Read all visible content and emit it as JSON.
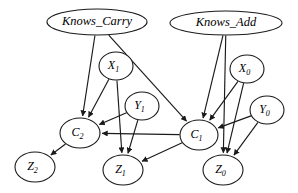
{
  "diagram": {
    "type": "directed-acyclic-graph",
    "background_color": "#ffffff",
    "stroke_color": "#1a1a1a",
    "nodes": [
      {
        "id": "knows_carry",
        "label": "Knows_Carry",
        "base": "Knows_Carry",
        "sub": "",
        "cx": 97,
        "cy": 22,
        "rx": 50,
        "ry": 13,
        "kind": "root-skill"
      },
      {
        "id": "knows_add",
        "label": "Knows_Add",
        "base": "Knows_Add",
        "sub": "",
        "cx": 226,
        "cy": 23,
        "rx": 56,
        "ry": 12,
        "kind": "root-skill"
      },
      {
        "id": "x1",
        "label": "X1",
        "base": "X",
        "sub": "1",
        "cx": 116,
        "cy": 66,
        "rx": 17,
        "ry": 14,
        "kind": "input"
      },
      {
        "id": "x0",
        "label": "X0",
        "base": "X",
        "sub": "0",
        "cx": 247,
        "cy": 69,
        "rx": 17,
        "ry": 14,
        "kind": "input"
      },
      {
        "id": "y1",
        "label": "Y1",
        "base": "Y",
        "sub": "1",
        "cx": 142,
        "cy": 106,
        "rx": 17,
        "ry": 14,
        "kind": "input"
      },
      {
        "id": "y0",
        "label": "Y0",
        "base": "Y",
        "sub": "0",
        "cx": 267,
        "cy": 110,
        "rx": 17,
        "ry": 14,
        "kind": "input"
      },
      {
        "id": "c2",
        "label": "C2",
        "base": "C",
        "sub": "2",
        "cx": 80,
        "cy": 133,
        "rx": 20,
        "ry": 15,
        "kind": "carry"
      },
      {
        "id": "c1",
        "label": "C1",
        "base": "C",
        "sub": "1",
        "cx": 199,
        "cy": 135,
        "rx": 19,
        "ry": 15,
        "kind": "carry"
      },
      {
        "id": "z2",
        "label": "Z2",
        "base": "Z",
        "sub": "2",
        "cx": 35,
        "cy": 167,
        "rx": 20,
        "ry": 15,
        "kind": "output"
      },
      {
        "id": "z1",
        "label": "Z1",
        "base": "Z",
        "sub": "1",
        "cx": 123,
        "cy": 170,
        "rx": 20,
        "ry": 15,
        "kind": "output"
      },
      {
        "id": "z0",
        "label": "Z0",
        "base": "Z",
        "sub": "0",
        "cx": 223,
        "cy": 170,
        "rx": 20,
        "ry": 15,
        "kind": "output"
      }
    ],
    "edges": [
      {
        "from": "knows_carry",
        "to": "c2"
      },
      {
        "from": "knows_carry",
        "to": "c1"
      },
      {
        "from": "knows_add",
        "to": "c1"
      },
      {
        "from": "knows_add",
        "to": "z0"
      },
      {
        "from": "x1",
        "to": "c2"
      },
      {
        "from": "x1",
        "to": "z1"
      },
      {
        "from": "y1",
        "to": "c2"
      },
      {
        "from": "y1",
        "to": "z1"
      },
      {
        "from": "x0",
        "to": "c1"
      },
      {
        "from": "x0",
        "to": "z0"
      },
      {
        "from": "y0",
        "to": "c1"
      },
      {
        "from": "y0",
        "to": "z0"
      },
      {
        "from": "c1",
        "to": "c2"
      },
      {
        "from": "c1",
        "to": "z1"
      },
      {
        "from": "c2",
        "to": "z2"
      }
    ]
  }
}
